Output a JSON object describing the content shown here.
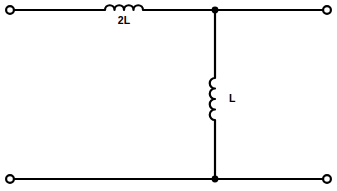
{
  "diagram": {
    "type": "electrical-schematic",
    "canvas": {
      "width": 337,
      "height": 191,
      "background": "#ffffff"
    },
    "line_color": "#000000",
    "components": [
      {
        "id": "series-inductor",
        "kind": "inductor",
        "orientation": "horizontal",
        "label": "2L",
        "label_position": "below",
        "turns": 4,
        "value_text": "2L"
      },
      {
        "id": "shunt-inductor",
        "kind": "inductor",
        "orientation": "vertical",
        "label": "L",
        "label_position": "right",
        "turns": 4,
        "value_text": "L"
      }
    ],
    "terminals": [
      {
        "id": "input-top",
        "label": "",
        "style": "open-circle",
        "x": 10,
        "y": 10
      },
      {
        "id": "output-top",
        "label": "",
        "style": "open-circle",
        "x": 327,
        "y": 10
      },
      {
        "id": "input-bottom",
        "label": "",
        "style": "open-circle",
        "x": 10,
        "y": 179
      },
      {
        "id": "output-bottom",
        "label": "",
        "style": "open-circle",
        "x": 327,
        "y": 179
      }
    ],
    "junctions": [
      {
        "id": "node-top",
        "x": 215,
        "y": 10,
        "style": "filled-dot"
      },
      {
        "id": "node-bottom",
        "x": 215,
        "y": 179,
        "style": "filled-dot"
      }
    ]
  }
}
